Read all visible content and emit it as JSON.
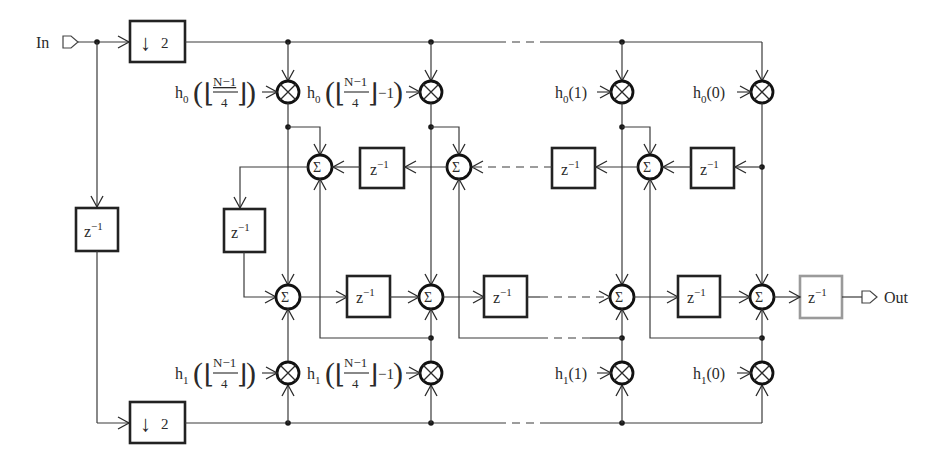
{
  "diagram": {
    "input_label": "In",
    "output_label": "Out",
    "downsample_top": {
      "arrow": "↓",
      "factor": "2"
    },
    "downsample_bottom": {
      "arrow": "↓",
      "factor": "2"
    },
    "delay_label": "z",
    "delay_exp": "−1",
    "sum_symbol": "Σ",
    "mult_symbol": "⊗",
    "coeffs_top": [
      {
        "name": "h",
        "sub": "0",
        "arg_num": "N−1",
        "arg_den": "4",
        "suffix": "",
        "id": "h0_floor"
      },
      {
        "name": "h",
        "sub": "0",
        "arg_num": "N−1",
        "arg_den": "4",
        "suffix": "−1",
        "id": "h0_floor_minus1"
      },
      {
        "name": "h",
        "sub": "0",
        "arg": "(1)",
        "id": "h0_1"
      },
      {
        "name": "h",
        "sub": "0",
        "arg": "(0)",
        "id": "h0_0"
      }
    ],
    "coeffs_bottom": [
      {
        "name": "h",
        "sub": "1",
        "arg_num": "N−1",
        "arg_den": "4",
        "suffix": "",
        "id": "h1_floor"
      },
      {
        "name": "h",
        "sub": "1",
        "arg_num": "N−1",
        "arg_den": "4",
        "suffix": "−1",
        "id": "h1_floor_minus1"
      },
      {
        "name": "h",
        "sub": "1",
        "arg": "(1)",
        "id": "h1_1"
      },
      {
        "name": "h",
        "sub": "1",
        "arg": "(0)",
        "id": "h1_0"
      }
    ],
    "colors": {
      "wire": "#3a3a3a",
      "block_border": "#222222",
      "output_delay_border": "#9a9a9a"
    }
  }
}
